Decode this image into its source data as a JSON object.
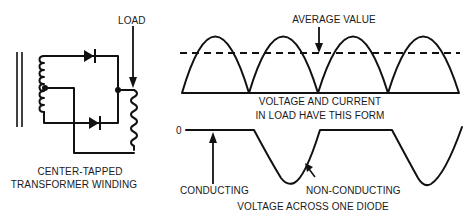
{
  "circuit": {
    "load_label": "LOAD",
    "caption_line1": "CENTER-TAPPED",
    "caption_line2": "TRANSFORMER WINDING",
    "components": [
      "transformer-core",
      "center-tapped-secondary-winding",
      "diode-upper",
      "diode-lower",
      "load-resistor"
    ]
  },
  "load_waveform": {
    "average_label": "AVERAGE VALUE",
    "caption_line1": "VOLTAGE AND CURRENT",
    "caption_line2": "IN LOAD HAVE THIS FORM",
    "humps": 4
  },
  "diode_waveform": {
    "zero_label": "0",
    "conducting_label": "CONDUCTING",
    "non_conducting_label": "NON-CONDUCTING",
    "caption": "VOLTAGE ACROSS ONE DIODE"
  },
  "colors": {
    "ink": "#111111",
    "background": "#ffffff"
  }
}
